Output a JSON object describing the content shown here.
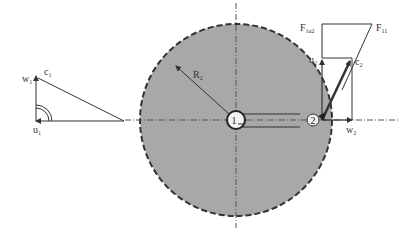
{
  "diagram": {
    "type": "impeller-velocity-force-diagram",
    "colors": {
      "impeller_fill": "#a8a8a8",
      "line": "#333333",
      "background": "#ffffff"
    },
    "left_triangle": {
      "labels": {
        "w": "w",
        "w_sub": "1",
        "c": "c",
        "c_sub": "1",
        "u": "u",
        "u_sub": "1"
      }
    },
    "impeller": {
      "radius_label": "R",
      "radius_sub": "2",
      "point_1": "1",
      "point_2": "2"
    },
    "right_diagram": {
      "labels": {
        "f_u2": "F",
        "f_u2_sub": "1u2",
        "f_11": "F",
        "f_11_sub": "11",
        "u": "u",
        "u_sub": "2",
        "c": "c",
        "c_sub": "2",
        "w": "w",
        "w_sub": "2"
      }
    }
  }
}
